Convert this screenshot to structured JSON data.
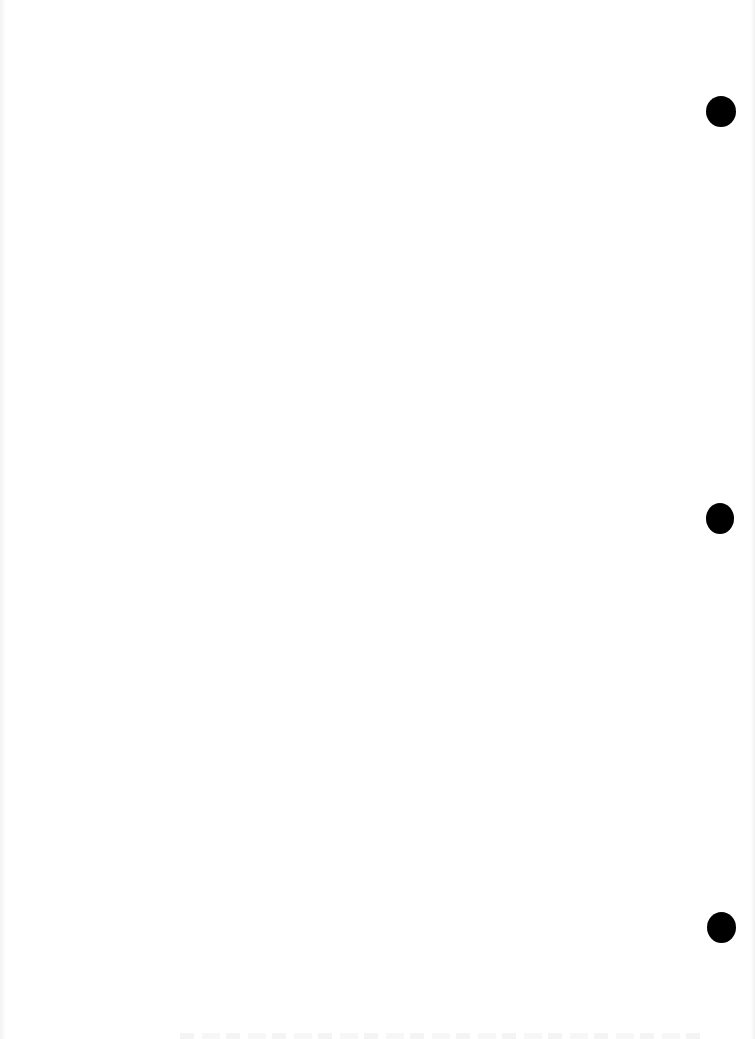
{
  "page": {
    "background_color": "#ffffff",
    "width": 755,
    "height": 1039,
    "text_content": ""
  },
  "punch_holes": [
    {
      "cx": 721,
      "cy": 111,
      "w": 30,
      "h": 31,
      "color": "#000000"
    },
    {
      "cx": 720,
      "cy": 518,
      "w": 28,
      "h": 31,
      "color": "#000000"
    },
    {
      "cx": 721,
      "cy": 927,
      "w": 29,
      "h": 31,
      "color": "#000000"
    }
  ]
}
